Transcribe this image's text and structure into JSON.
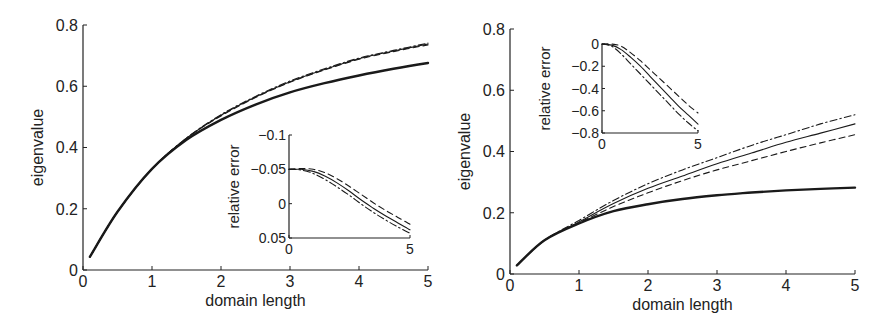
{
  "chart_data": [
    {
      "type": "line",
      "panel": "left",
      "title": "",
      "xlabel": "domain length",
      "ylabel": "eigenvalue",
      "xlim": [
        0,
        5
      ],
      "ylim": [
        0,
        0.8
      ],
      "xticks": [
        "0",
        "1",
        "2",
        "3",
        "4",
        "5"
      ],
      "yticks": [
        "0",
        "0.2",
        "0.4",
        "0.6",
        "0.8"
      ],
      "grid": false,
      "x": [
        0.1,
        0.5,
        1,
        1.5,
        2,
        2.5,
        3,
        3.5,
        4,
        4.5,
        5
      ],
      "series": [
        {
          "name": "exact (thick solid)",
          "style": "thick-solid",
          "values": [
            0.043,
            0.19,
            0.33,
            0.425,
            0.49,
            0.54,
            0.58,
            0.61,
            0.635,
            0.657,
            0.676
          ]
        },
        {
          "name": "approx (solid)",
          "style": "solid",
          "values": [
            0.043,
            0.19,
            0.33,
            0.43,
            0.505,
            0.565,
            0.615,
            0.655,
            0.69,
            0.715,
            0.738
          ]
        },
        {
          "name": "approx (dashed)",
          "style": "dashed",
          "values": [
            0.043,
            0.19,
            0.33,
            0.43,
            0.503,
            0.563,
            0.613,
            0.653,
            0.688,
            0.713,
            0.735
          ]
        },
        {
          "name": "approx (dash-dot)",
          "style": "dash-dot",
          "values": [
            0.043,
            0.19,
            0.33,
            0.431,
            0.507,
            0.567,
            0.617,
            0.657,
            0.692,
            0.717,
            0.741
          ]
        }
      ],
      "inset": {
        "ylabel": "relative error",
        "xlim": [
          0,
          5
        ],
        "ylim": [
          -0.1,
          0.05
        ],
        "xticks": [
          "0",
          "5"
        ],
        "yticks": [
          "0.05",
          "0",
          "−0.05",
          "−0.1"
        ],
        "x": [
          0,
          0.5,
          1,
          1.5,
          2,
          2.5,
          3,
          3.5,
          4,
          4.5,
          5
        ],
        "series": [
          {
            "name": "solid",
            "style": "solid",
            "values": [
              0.0,
              0.0,
              -0.003,
              -0.01,
              -0.02,
              -0.032,
              -0.045,
              -0.057,
              -0.068,
              -0.078,
              -0.088
            ]
          },
          {
            "name": "dashed",
            "style": "dashed",
            "values": [
              0.0,
              0.001,
              0.0,
              -0.005,
              -0.014,
              -0.025,
              -0.037,
              -0.049,
              -0.06,
              -0.07,
              -0.08
            ]
          },
          {
            "name": "dash-dot",
            "style": "dash-dot",
            "values": [
              0.0,
              -0.001,
              -0.006,
              -0.015,
              -0.026,
              -0.038,
              -0.051,
              -0.063,
              -0.074,
              -0.084,
              -0.093
            ]
          }
        ]
      }
    },
    {
      "type": "line",
      "panel": "right",
      "title": "",
      "xlabel": "domain length",
      "ylabel": "eigenvalue",
      "xlim": [
        0,
        5
      ],
      "ylim": [
        0,
        0.8
      ],
      "xticks": [
        "0",
        "1",
        "2",
        "3",
        "4",
        "5"
      ],
      "yticks": [
        "0",
        "0.2",
        "0.4",
        "0.6",
        "0.8"
      ],
      "grid": false,
      "x": [
        0.1,
        0.5,
        1,
        1.5,
        2,
        2.5,
        3,
        3.5,
        4,
        4.5,
        5
      ],
      "series": [
        {
          "name": "exact (thick solid)",
          "style": "thick-solid",
          "values": [
            0.028,
            0.11,
            0.165,
            0.205,
            0.228,
            0.245,
            0.257,
            0.266,
            0.273,
            0.278,
            0.282
          ]
        },
        {
          "name": "approx (solid)",
          "style": "solid",
          "values": [
            0.028,
            0.11,
            0.17,
            0.23,
            0.28,
            0.32,
            0.36,
            0.395,
            0.43,
            0.46,
            0.49
          ]
        },
        {
          "name": "approx (dashed)",
          "style": "dashed",
          "values": [
            0.028,
            0.11,
            0.167,
            0.22,
            0.265,
            0.305,
            0.34,
            0.37,
            0.4,
            0.428,
            0.455
          ]
        },
        {
          "name": "approx (dash-dot)",
          "style": "dash-dot",
          "values": [
            0.028,
            0.11,
            0.175,
            0.24,
            0.295,
            0.34,
            0.38,
            0.42,
            0.455,
            0.49,
            0.52
          ]
        }
      ],
      "inset": {
        "ylabel": "relative error",
        "xlim": [
          0,
          5
        ],
        "ylim": [
          -0.8,
          0.0
        ],
        "xticks": [
          "0",
          "5"
        ],
        "yticks": [
          "0",
          "−0.2",
          "−0.4",
          "−0.6",
          "−0.8"
        ],
        "x": [
          0,
          0.5,
          1,
          1.5,
          2,
          2.5,
          3,
          3.5,
          4,
          4.5,
          5
        ],
        "series": [
          {
            "name": "solid",
            "style": "solid",
            "values": [
              0.0,
              -0.01,
              -0.05,
              -0.12,
              -0.2,
              -0.29,
              -0.38,
              -0.47,
              -0.56,
              -0.64,
              -0.72
            ]
          },
          {
            "name": "dashed",
            "style": "dashed",
            "values": [
              0.0,
              0.0,
              -0.02,
              -0.08,
              -0.15,
              -0.23,
              -0.31,
              -0.39,
              -0.47,
              -0.55,
              -0.62
            ]
          },
          {
            "name": "dash-dot",
            "style": "dash-dot",
            "values": [
              0.0,
              -0.02,
              -0.09,
              -0.18,
              -0.27,
              -0.36,
              -0.45,
              -0.54,
              -0.63,
              -0.71,
              -0.78
            ]
          }
        ]
      }
    }
  ]
}
